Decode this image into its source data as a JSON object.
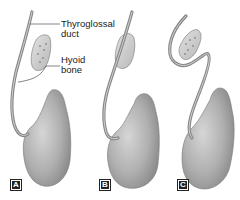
{
  "figure": {
    "labels": {
      "duct": "Thyroglossal\nduct",
      "duct_line1": "Thyroglossal",
      "duct_line2": "duct",
      "bone_line1": "Hyoid",
      "bone_line2": "bone"
    },
    "panels": [
      {
        "id": "A",
        "badge": "A",
        "description": "Duct passes anterior to hyoid bone"
      },
      {
        "id": "B",
        "badge": "B",
        "description": "Duct passes through hyoid bone"
      },
      {
        "id": "C",
        "badge": "C",
        "description": "Duct loops posterior to hyoid bone"
      }
    ],
    "colors": {
      "gland": "#a9a9a9",
      "gland_highlight": "#d2d2d2",
      "duct": "#8e8e8e",
      "bone": "#cfcfcf",
      "label_text": "#222222",
      "leader_line": "#333333"
    }
  }
}
